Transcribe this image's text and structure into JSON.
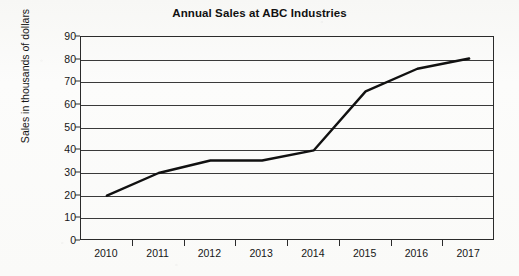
{
  "chart": {
    "title": "Annual Sales at ABC Industries",
    "y_axis_title": "Sales in thousands of dollars"
  },
  "chart_data": {
    "type": "line",
    "title": "Annual Sales at ABC Industries",
    "xlabel": "",
    "ylabel": "Sales in thousands of dollars",
    "categories": [
      "2010",
      "2011",
      "2012",
      "2013",
      "2014",
      "2015",
      "2016",
      "2017"
    ],
    "values": [
      20,
      30,
      35.5,
      35.5,
      40,
      66,
      76,
      80.5
    ],
    "ylim": [
      0,
      90
    ],
    "ytick_step": 10,
    "yticks": [
      0,
      10,
      20,
      30,
      40,
      50,
      60,
      70,
      80,
      90
    ],
    "ytick_labels": [
      "0",
      "10",
      "20",
      "30",
      "40",
      "50",
      "60",
      "70",
      "80",
      "90"
    ],
    "grid": "horizontal",
    "legend": "none",
    "series": [
      {
        "name": "Annual Sales",
        "color": "#111111",
        "values": [
          20,
          30,
          35.5,
          35.5,
          40,
          66,
          76,
          80.5
        ]
      }
    ]
  },
  "colors": {
    "line": "#111111",
    "grid": "#3a3a3a",
    "frame": "#2b2b2b",
    "background": "#fbfbfa",
    "text": "#161616"
  }
}
